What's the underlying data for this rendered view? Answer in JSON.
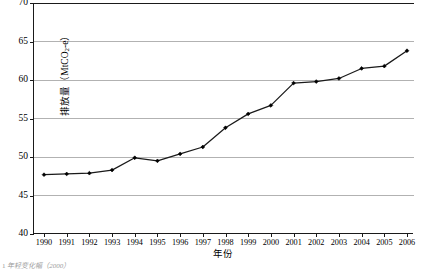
{
  "chart_data": {
    "type": "line",
    "title": "",
    "xlabel": "年份",
    "ylabel_text": "排放量（MtCO",
    "ylabel_sub": "2",
    "ylabel_tail": "-e）",
    "ylabel_full": "排放量（MtCO2-e）",
    "categories": [
      "1990",
      "1991",
      "1992",
      "1993",
      "1994",
      "1995",
      "1996",
      "1997",
      "1998",
      "1999",
      "2000",
      "2001",
      "2002",
      "2003",
      "2004",
      "2005",
      "2006"
    ],
    "values": [
      47.7,
      47.8,
      47.9,
      48.3,
      49.9,
      49.5,
      50.4,
      51.3,
      53.8,
      55.6,
      56.7,
      59.6,
      59.8,
      60.2,
      61.5,
      61.8,
      63.8
    ],
    "series": [
      {
        "name": "排放量",
        "values": [
          47.7,
          47.8,
          47.9,
          48.3,
          49.9,
          49.5,
          50.4,
          51.3,
          53.8,
          55.6,
          56.7,
          59.6,
          59.8,
          60.2,
          61.5,
          61.8,
          63.8
        ]
      }
    ],
    "ylim": [
      40,
      70
    ],
    "yticks": [
      40,
      45,
      50,
      55,
      60,
      65,
      70
    ],
    "ytick_labels": [
      "40",
      "45",
      "50",
      "55",
      "60",
      "65",
      "70"
    ],
    "xlim_categories": true,
    "grid": "horizontal",
    "legend": "none",
    "line_color": "#1a1a1a",
    "marker": "diamond",
    "marker_color": "#000000",
    "gridline_color": "#b2b2b2",
    "axis_color": "#1a1a1a",
    "background": "#ffffff"
  },
  "caption": {
    "prefix": "1",
    "text": "年轻变化幅（2000）"
  }
}
